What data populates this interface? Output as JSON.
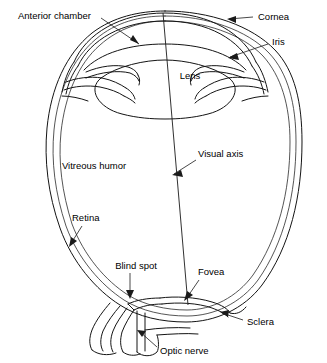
{
  "figure": {
    "background_color": "#ffffff",
    "line_color": "#141414",
    "text_color": "#000000",
    "style": "line-art anatomical diagram"
  },
  "labels": {
    "anterior_chamber": "Anterior chamber",
    "cornea": "Cornea",
    "iris": "Iris",
    "lens": "Lens",
    "visual_axis": "Visual axis",
    "vitreous_humor": "Vitreous humor",
    "retina": "Retina",
    "blind_spot": "Blind spot",
    "fovea": "Fovea",
    "sclera": "Sclera",
    "optic_nerve": "Optic nerve"
  },
  "structures": [
    {
      "name": "cornea",
      "description": "transparent domed front surface"
    },
    {
      "name": "anterior-chamber",
      "description": "space between cornea and lens"
    },
    {
      "name": "iris",
      "description": "pigmented diaphragm around pupil"
    },
    {
      "name": "lens",
      "description": "biconvex focusing element"
    },
    {
      "name": "vitreous-humor",
      "description": "gel filling the main eyeball cavity"
    },
    {
      "name": "retina",
      "description": "innermost light sensitive layer"
    },
    {
      "name": "choroid",
      "description": "middle vascular layer"
    },
    {
      "name": "sclera",
      "description": "outer tough white coat"
    },
    {
      "name": "fovea",
      "description": "central pit of sharpest vision"
    },
    {
      "name": "blind-spot",
      "description": "optic disc where nerve exits"
    },
    {
      "name": "optic-nerve",
      "description": "nerve bundle leaving the eye"
    },
    {
      "name": "visual-axis",
      "description": "line from cornea apex to fovea"
    }
  ]
}
